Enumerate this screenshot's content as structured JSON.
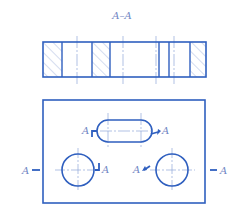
{
  "section_view": {
    "title": "A–A",
    "outline": {
      "x1": 43,
      "y1": 42,
      "x2": 206,
      "y2": 77
    },
    "dividers_x": [
      62,
      92,
      110,
      159,
      169,
      190
    ],
    "hatched_regions": [
      [
        43,
        62
      ],
      [
        92,
        110
      ],
      [
        190,
        206
      ]
    ],
    "center_lines_x": [
      77,
      123,
      156,
      174
    ]
  },
  "plan_view": {
    "outline": {
      "x1": 43,
      "y1": 100,
      "x2": 205,
      "y2": 203
    },
    "slot": {
      "cx": 125,
      "cy": 131,
      "half_length": 17,
      "radius": 11
    },
    "circles": [
      {
        "cx": 78,
        "cy": 170,
        "r": 16
      },
      {
        "cx": 172,
        "cy": 170,
        "r": 16
      }
    ],
    "labels": {
      "slot_left": "A",
      "slot_right": "A",
      "left_outer": "A",
      "left_circle": "A",
      "right_circle": "A",
      "right_outer": "A"
    }
  },
  "colors": {
    "line": "#2f5fbf",
    "thin": "#8fa6d8",
    "hatch": "#9fb2dc",
    "text": "#6f86c4"
  }
}
